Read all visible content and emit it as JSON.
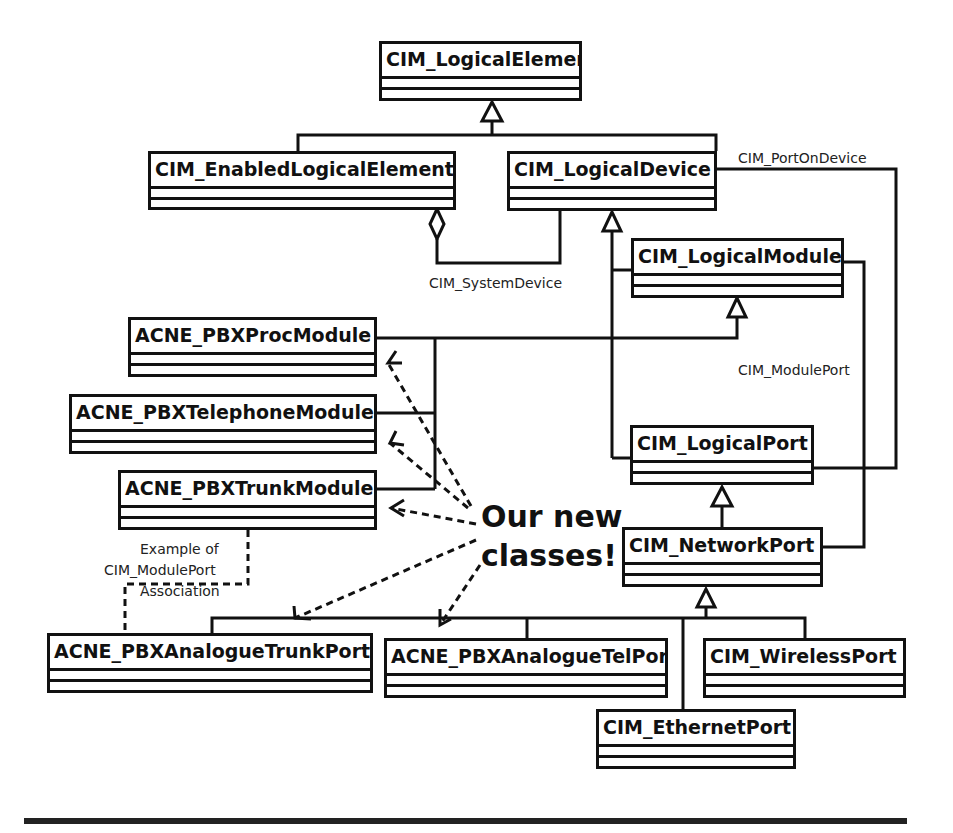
{
  "diagram": {
    "type": "UML class diagram",
    "classes": [
      {
        "id": "logical_element",
        "name": "CIM_LogicalElement"
      },
      {
        "id": "enabled_logical_element",
        "name": "CIM_EnabledLogicalElement"
      },
      {
        "id": "logical_device",
        "name": "CIM_LogicalDevice"
      },
      {
        "id": "logical_module",
        "name": "CIM_LogicalModule"
      },
      {
        "id": "pbx_proc_module",
        "name": "ACNE_PBXProcModule"
      },
      {
        "id": "pbx_telephone_module",
        "name": "ACNE_PBXTelephoneModule"
      },
      {
        "id": "pbx_trunk_module",
        "name": "ACNE_PBXTrunkModule"
      },
      {
        "id": "logical_port",
        "name": "CIM_LogicalPort"
      },
      {
        "id": "network_port",
        "name": "CIM_NetworkPort"
      },
      {
        "id": "pbx_analogue_trunk_port",
        "name": "ACNE_PBXAnalogueTrunkPort"
      },
      {
        "id": "pbx_analogue_tel_port",
        "name": "ACNE_PBXAnalogueTelPort"
      },
      {
        "id": "wireless_port",
        "name": "CIM_WirelessPort"
      },
      {
        "id": "ethernet_port",
        "name": "CIM_EthernetPort"
      }
    ],
    "associations": {
      "port_on_device": "CIM_PortOnDevice",
      "system_device": "CIM_SystemDevice",
      "module_port": "CIM_ModulePort"
    },
    "note": {
      "line1": "Example of",
      "line2": "CIM_ModulePort",
      "line3": "Association"
    },
    "callout": {
      "line1": "Our new",
      "line2": "classes!"
    },
    "generalizations": [
      {
        "child": "CIM_EnabledLogicalElement",
        "parent": "CIM_LogicalElement"
      },
      {
        "child": "CIM_LogicalDevice",
        "parent": "CIM_LogicalElement"
      },
      {
        "child": "CIM_LogicalModule",
        "parent": "CIM_LogicalDevice"
      },
      {
        "child": "CIM_LogicalPort",
        "parent": "CIM_LogicalDevice"
      },
      {
        "child": "ACNE_PBXProcModule",
        "parent": "CIM_LogicalModule"
      },
      {
        "child": "ACNE_PBXTelephoneModule",
        "parent": "CIM_LogicalModule"
      },
      {
        "child": "ACNE_PBXTrunkModule",
        "parent": "CIM_LogicalModule"
      },
      {
        "child": "CIM_NetworkPort",
        "parent": "CIM_LogicalPort"
      },
      {
        "child": "ACNE_PBXAnalogueTrunkPort",
        "parent": "CIM_NetworkPort"
      },
      {
        "child": "ACNE_PBXAnalogueTelPort",
        "parent": "CIM_NetworkPort"
      },
      {
        "child": "CIM_WirelessPort",
        "parent": "CIM_NetworkPort"
      },
      {
        "child": "CIM_EthernetPort",
        "parent": "CIM_NetworkPort"
      }
    ]
  }
}
